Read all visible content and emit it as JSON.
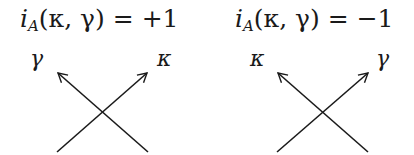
{
  "diagrams": [
    {
      "id": "positive",
      "title": {
        "func": "i",
        "subscript": "A",
        "args": "(κ, γ)",
        "equals": "=",
        "value": "+1"
      },
      "left_label": "γ",
      "right_label": "κ",
      "strands": [
        {
          "name": "kappa",
          "from": [
            57,
            152
          ],
          "to": [
            147,
            73
          ],
          "over": true
        },
        {
          "name": "gamma",
          "from": [
            148,
            152
          ],
          "to": [
            58,
            73
          ],
          "over": false
        }
      ]
    },
    {
      "id": "negative",
      "title": {
        "func": "i",
        "subscript": "A",
        "args": "(κ, γ)",
        "equals": "=",
        "value": "−1"
      },
      "left_label": "κ",
      "right_label": "γ",
      "strands": [
        {
          "name": "gamma",
          "from": [
            277,
            152
          ],
          "to": [
            368,
            73
          ],
          "over": true
        },
        {
          "name": "kappa",
          "from": [
            368,
            152
          ],
          "to": [
            278,
            73
          ],
          "over": false
        }
      ]
    }
  ],
  "colors": {
    "stroke": "#1a1a1a",
    "background": "#ffffff"
  }
}
